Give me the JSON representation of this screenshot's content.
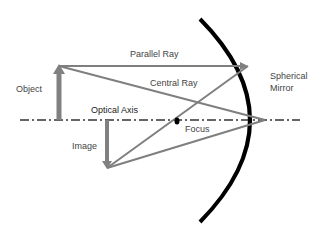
{
  "diagram": {
    "labels": {
      "object": "Object",
      "parallel_ray": "Parallel Ray",
      "central_ray": "Central Ray",
      "optical_axis": "Optical Axis",
      "image": "Image",
      "focus": "Focus",
      "mirror_line1": "Spherical",
      "mirror_line2": "Mirror"
    },
    "colors": {
      "rays": "#7f7f7f",
      "object_arrow": "#808080",
      "mirror": "#000000",
      "axis": "#333333",
      "text": "#444444"
    },
    "geometry": {
      "axis_y": 120,
      "object": {
        "x": 59,
        "top_y": 66
      },
      "image": {
        "x": 107,
        "bottom_y": 168
      },
      "mirror_vertex": {
        "x": 265,
        "y": 120
      },
      "parallel_hit": {
        "x": 248,
        "y": 66
      },
      "focus": {
        "x": 177,
        "y": 121
      }
    }
  }
}
